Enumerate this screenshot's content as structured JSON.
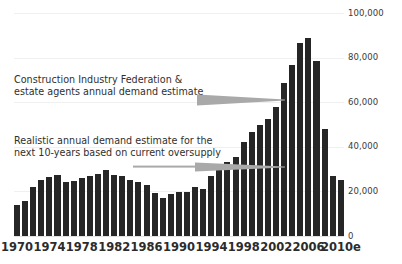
{
  "chart_data": {
    "type": "bar",
    "title": "",
    "subtitle": "",
    "xlabel": "",
    "ylabel": "",
    "ylim": [
      0,
      100000
    ],
    "yticks": [
      0,
      20000,
      40000,
      60000,
      80000,
      100000
    ],
    "ytick_labels": [
      "0",
      "20,000",
      "40,000",
      "60,000",
      "80,000",
      "100,000"
    ],
    "ytick_side": "right",
    "grid": true,
    "legend": "none",
    "bar_color": "#262626",
    "background": "#ffffff",
    "categories": [
      "1970",
      "1971",
      "1972",
      "1973",
      "1974",
      "1975",
      "1976",
      "1977",
      "1978",
      "1979",
      "1980",
      "1981",
      "1982",
      "1983",
      "1984",
      "1985",
      "1986",
      "1987",
      "1988",
      "1989",
      "1990",
      "1991",
      "1992",
      "1993",
      "1994",
      "1995",
      "1996",
      "1997",
      "1998",
      "1999",
      "2000",
      "2001",
      "2002",
      "2003",
      "2004",
      "2005",
      "2006",
      "2007",
      "2008",
      "2009",
      "2010e"
    ],
    "values": [
      13800,
      15500,
      21800,
      25000,
      26500,
      27200,
      24200,
      24500,
      25800,
      26800,
      27800,
      29400,
      27300,
      26800,
      25000,
      24300,
      22700,
      19200,
      17100,
      18800,
      19800,
      19800,
      22100,
      21300,
      26900,
      31200,
      33300,
      35500,
      42300,
      46500,
      49800,
      52600,
      57700,
      68800,
      76500,
      86400,
      88900,
      78400,
      48000,
      26800,
      25000
    ],
    "xtick_labels": [
      "1970",
      "1974",
      "1978",
      "1982",
      "1986",
      "1990",
      "1994",
      "1998",
      "2002",
      "2006",
      "2010e"
    ],
    "xtick_categories": [
      "1970",
      "1974",
      "1978",
      "1982",
      "1986",
      "1990",
      "1994",
      "1998",
      "2002",
      "2006",
      "2010e"
    ],
    "annotations": [
      {
        "name": "cif-estimate",
        "line1": "Construction Industry Federation &",
        "line2": "estate agents annual demand estimate",
        "arrow": "tapered-right",
        "arrow_color": "#a9a9a9",
        "points_to_value": 60000
      },
      {
        "name": "realistic-estimate",
        "line1": "Realistic annual demand estimate for the",
        "line2": "next 10-years based on current oversupply",
        "arrow": "line-tapered-right",
        "arrow_color": "#a9a9a9",
        "points_to_value": 33000
      }
    ]
  }
}
